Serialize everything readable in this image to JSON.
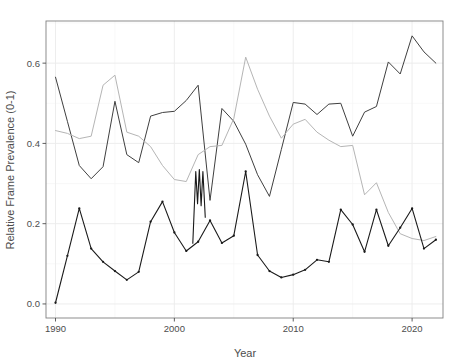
{
  "chart_data": {
    "type": "line",
    "title": "",
    "xlabel": "Year",
    "ylabel": "Relative Frame Prevalence (0-1)",
    "xlim": [
      1989.2,
      2022.6
    ],
    "ylim": [
      -0.035,
      0.705
    ],
    "xticks": [
      1990,
      2000,
      2010,
      2020
    ],
    "xtick_labels": [
      "1990",
      "2000",
      "2010",
      "2020"
    ],
    "yticks": [
      0.0,
      0.2,
      0.4,
      0.6
    ],
    "ytick_labels": [
      "0.0",
      "0.2",
      "0.4",
      "0.6"
    ],
    "grid": true,
    "grid_major_color": "#ebebeb",
    "grid_minor_color": "#f5f5f5",
    "panel_background": "#ffffff",
    "panel_border_color": "#808080",
    "legend": "none",
    "x": [
      1990,
      1991,
      1992,
      1993,
      1994,
      1995,
      1996,
      1997,
      1998,
      1999,
      2000,
      2001,
      2002,
      2003,
      2004,
      2005,
      2006,
      2007,
      2008,
      2009,
      2010,
      2011,
      2012,
      2013,
      2014,
      2015,
      2016,
      2017,
      2018,
      2019,
      2020,
      2021,
      2022
    ],
    "series": [
      {
        "name": "series-dark-gray",
        "color": "#3f3f3f",
        "linewidth": 1.0,
        "markers": false,
        "values": [
          0.565,
          0.455,
          0.345,
          0.312,
          0.342,
          0.505,
          0.372,
          0.352,
          0.468,
          0.477,
          0.48,
          0.507,
          0.545,
          0.258,
          0.487,
          0.455,
          0.398,
          0.322,
          0.268,
          0.385,
          0.502,
          0.498,
          0.472,
          0.498,
          0.5,
          0.418,
          0.478,
          0.492,
          0.603,
          0.573,
          0.668,
          0.628,
          0.6
        ]
      },
      {
        "name": "series-light-gray",
        "color": "#b5b5b5",
        "linewidth": 1.0,
        "markers": false,
        "values": [
          0.432,
          0.425,
          0.412,
          0.418,
          0.545,
          0.57,
          0.428,
          0.418,
          0.392,
          0.345,
          0.31,
          0.305,
          0.372,
          0.392,
          0.395,
          0.462,
          0.615,
          0.535,
          0.468,
          0.413,
          0.448,
          0.46,
          0.428,
          0.408,
          0.392,
          0.395,
          0.272,
          0.302,
          0.228,
          0.175,
          0.163,
          0.158,
          0.168
        ]
      },
      {
        "name": "series-black",
        "color": "#1a1a1a",
        "linewidth": 1.1,
        "markers": true,
        "values": [
          0.003,
          0.12,
          0.238,
          0.138,
          0.105,
          0.082,
          0.06,
          0.08,
          0.205,
          0.255,
          0.178,
          0.132,
          0.155,
          0.208,
          0.152,
          0.17,
          0.33,
          0.122,
          0.082,
          0.066,
          0.073,
          0.085,
          0.11,
          0.105,
          0.088,
          0.07,
          0.055,
          0.052,
          0.053,
          0.065,
          0.103,
          0.145,
          0.178
        ]
      }
    ],
    "series_black_extra": {
      "note": "post-2014 tail of black series continuing to 2022",
      "x": [
        2014,
        2015,
        2016,
        2017,
        2018,
        2019,
        2020,
        2021,
        2022
      ],
      "values": [
        0.235,
        0.198,
        0.13,
        0.235,
        0.145,
        0.19,
        0.238,
        0.138,
        0.16
      ]
    }
  }
}
